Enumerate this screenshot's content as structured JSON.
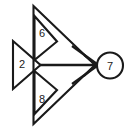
{
  "diagram": {
    "type": "node-arrow-graph",
    "background_color": "#ffffff",
    "stroke_color": "#1a1a1a",
    "nodes": [
      {
        "id": "left-triangle",
        "shape": "triangle",
        "label": "2",
        "orientation": "points-right",
        "label_x": 22,
        "label_y": 64
      },
      {
        "id": "top-triangle",
        "shape": "triangle",
        "label": "6",
        "orientation": "points-right",
        "label_x": 42,
        "label_y": 33
      },
      {
        "id": "bottom-triangle",
        "shape": "triangle",
        "label": "8",
        "orientation": "points-right",
        "label_x": 42,
        "label_y": 99
      },
      {
        "id": "target-circle",
        "shape": "circle",
        "label": "7",
        "label_x": 110,
        "label_y": 66
      }
    ],
    "edges": [
      {
        "id": "edge-2-to-7",
        "from": "left-triangle",
        "to": "target-circle",
        "arrow": true
      },
      {
        "id": "edge-6-to-7",
        "from": "top-triangle",
        "to": "target-circle",
        "arrow": true
      },
      {
        "id": "edge-8-to-7",
        "from": "bottom-triangle",
        "to": "target-circle",
        "arrow": true
      }
    ],
    "geometry": {
      "outer_triangle_path": "M 33.5 6 L 95 65 L 33.5 124 Z",
      "left_triangle_path": "M 13 41 L 40.5 65 L 13 89 Z",
      "top_triangle_path": "M 34.5 16 L 57 41.5 L 34.5 60 Z",
      "bottom_triangle_path": "M 34.5 71 L 57 90 L 34.5 114 Z",
      "connector_path": "M 39 65 L 96 65",
      "arrow_upper_path": "M 72 46 L 97 64",
      "arrow_lower_path": "M 72 84 L 97 66",
      "arrow_head_inner_path": "M 84 55 L 96 65 L 84 76",
      "circle_cx": 110,
      "circle_cy": 65.5,
      "circle_r": 13
    }
  }
}
